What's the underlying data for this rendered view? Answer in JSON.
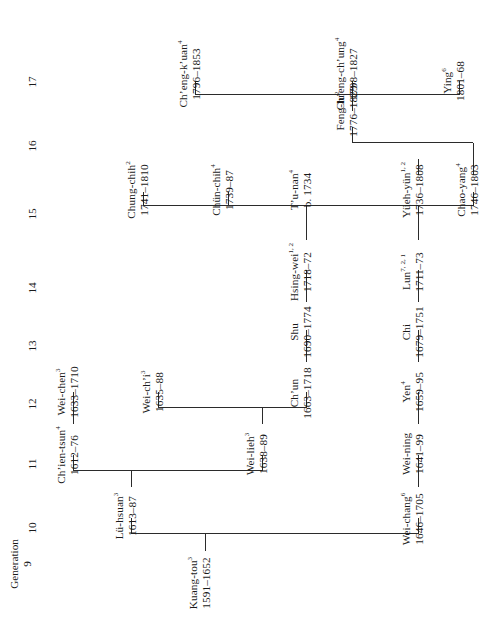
{
  "document": {
    "kind": "genealogy-chart",
    "orientation": "rotated-90-ccw",
    "header_label": "Generation"
  },
  "generations": [
    {
      "id": "g9",
      "number": "9"
    },
    {
      "id": "g10",
      "number": "10"
    },
    {
      "id": "g11",
      "number": "11"
    },
    {
      "id": "g12",
      "number": "12"
    },
    {
      "id": "g13",
      "number": "13"
    },
    {
      "id": "g14",
      "number": "14"
    },
    {
      "id": "g15",
      "number": "15"
    },
    {
      "id": "g16",
      "number": "16"
    },
    {
      "id": "g17",
      "number": "17"
    }
  ],
  "people": [
    {
      "id": "kuang-tou",
      "name": "Kuang-tou",
      "sup": "3",
      "dates": "1591–1652",
      "generation": "9"
    },
    {
      "id": "lu-hsuan",
      "name": "Lü-hsuan",
      "sup": "3",
      "dates": "1613–87",
      "generation": "10"
    },
    {
      "id": "wei-chang",
      "name": "Wei-chang",
      "sup": "6",
      "dates": "1646–1705",
      "generation": "10"
    },
    {
      "id": "chien-tsun",
      "name": "Ch’ien-tsun",
      "sup": "4",
      "dates": "1612–76",
      "generation": "11"
    },
    {
      "id": "wei-lieh",
      "name": "Wei-lieh",
      "sup": "3",
      "dates": "1638–89",
      "generation": "11"
    },
    {
      "id": "wei-ning",
      "name": "Wei-ning",
      "sup": "",
      "dates": "1641–99",
      "generation": "11"
    },
    {
      "id": "wei-chen",
      "name": "Wei-chen",
      "sup": "3",
      "dates": "1633–1710",
      "generation": "12"
    },
    {
      "id": "wei-chi",
      "name": "Wei-ch’i",
      "sup": "3",
      "dates": "1635–88",
      "generation": "12"
    },
    {
      "id": "chun",
      "name": "Ch’un",
      "sup": "",
      "dates": "1663–1718",
      "generation": "12"
    },
    {
      "id": "yen",
      "name": "Yen",
      "sup": "4",
      "dates": "1659–95",
      "generation": "12"
    },
    {
      "id": "shu",
      "name": "Shu",
      "sup": "",
      "dates": "1690–1774",
      "generation": "13"
    },
    {
      "id": "chi",
      "name": "Chi",
      "sup": "",
      "dates": "1679–1751",
      "generation": "13"
    },
    {
      "id": "hsing-wei",
      "name": "Hsing-wei",
      "sup": "1, 2",
      "dates": "1718–72",
      "generation": "14"
    },
    {
      "id": "lun",
      "name": "Lun",
      "sup": "7, 2, 1",
      "dates": "1711–73",
      "generation": "14"
    },
    {
      "id": "chung-chih",
      "name": "Chung-chih",
      "sup": "2",
      "dates": "1741–1810",
      "generation": "15"
    },
    {
      "id": "chun-chih",
      "name": "Chün-chih",
      "sup": "4",
      "dates": "1739–87",
      "generation": "15"
    },
    {
      "id": "tu-nan",
      "name": "T’u-nan",
      "sup": "4",
      "dates": "b. 1734",
      "generation": "15"
    },
    {
      "id": "yueh-yun",
      "name": "Yüeh-yün",
      "sup": "1, 2",
      "dates": "1736–1808",
      "generation": "15"
    },
    {
      "id": "chao-yang",
      "name": "Chao-yang",
      "sup": "4",
      "dates": "1746–1803",
      "generation": "15"
    },
    {
      "id": "feng-lu",
      "name": "Feng-lu",
      "sup": "2",
      "dates": "1776–1829",
      "generation": "16"
    },
    {
      "id": "cheng-kuan",
      "name": "Ch’eng-k’uan",
      "sup": "4",
      "dates": "1796–1853",
      "generation": "17"
    },
    {
      "id": "cheng-chung",
      "name": "Ch’eng-ch’ung",
      "sup": "4",
      "dates": "1798–1827",
      "generation": "17"
    },
    {
      "id": "ying",
      "name": "Ying",
      "sup": "6",
      "dates": "1801–68",
      "generation": "17"
    }
  ],
  "edges": [
    {
      "from": "kuang-tou",
      "to": "lu-hsuan"
    },
    {
      "from": "kuang-tou",
      "to": "wei-chang"
    },
    {
      "from": "lu-hsuan",
      "to": "chien-tsun"
    },
    {
      "from": "lu-hsuan",
      "to": "wei-lieh"
    },
    {
      "from": "wei-chang",
      "to": "wei-ning"
    },
    {
      "from": "chien-tsun",
      "to": "wei-chen"
    },
    {
      "from": "wei-lieh",
      "to": "wei-chi"
    },
    {
      "from": "wei-lieh",
      "to": "chun"
    },
    {
      "from": "wei-ning",
      "to": "yen"
    },
    {
      "from": "chun",
      "to": "shu"
    },
    {
      "from": "yen",
      "to": "chi"
    },
    {
      "from": "shu",
      "to": "hsing-wei"
    },
    {
      "from": "chi",
      "to": "lun"
    },
    {
      "from": "hsing-wei",
      "to": "tu-nan"
    },
    {
      "from": "lun",
      "to": "yueh-yun"
    },
    {
      "from": "yueh-yun",
      "to": "chung-chih"
    },
    {
      "from": "yueh-yun",
      "to": "chun-chih"
    },
    {
      "from": "yueh-yun",
      "to": "chao-yang"
    },
    {
      "from": "chao-yang",
      "to": "feng-lu"
    },
    {
      "from": "feng-lu",
      "to": "cheng-kuan"
    },
    {
      "from": "feng-lu",
      "to": "cheng-chung"
    },
    {
      "from": "feng-lu",
      "to": "ying"
    }
  ],
  "colors": {
    "background": "#ffffff",
    "text": "#1a1a1a",
    "line": "#2b2b2b"
  }
}
